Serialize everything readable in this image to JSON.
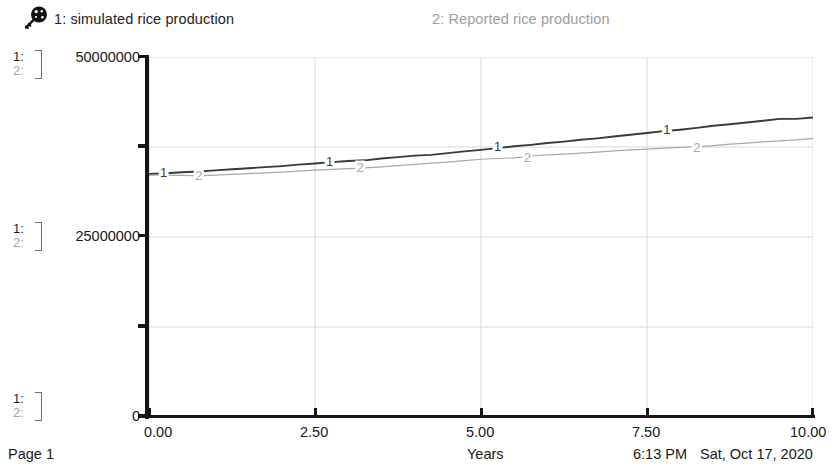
{
  "legend": {
    "icon": "key-icon",
    "series_1": "1: simulated rice production",
    "series_2": "2: Reported rice production"
  },
  "axis_index": {
    "row1": "1:",
    "row2": "2:"
  },
  "y_axis": {
    "top": "50000000",
    "mid": "25000000",
    "bottom": "0"
  },
  "x_axis": {
    "title": "Years",
    "ticks": [
      "0.00",
      "2.50",
      "5.00",
      "7.50",
      "10.00"
    ]
  },
  "footer": {
    "page": "Page 1",
    "time": "6:13 PM",
    "date": "Sat, Oct 17, 2020"
  },
  "colors": {
    "series_1": "#3a3a3a",
    "series_2": "#a8a8a8",
    "axis": "#151515",
    "grid": "#d8d8d8"
  },
  "chart_data": {
    "type": "line",
    "title": "",
    "xlabel": "Years",
    "ylabel": "",
    "xlim": [
      0,
      10
    ],
    "ylim": [
      0,
      50000000
    ],
    "grid": true,
    "legend_position": "top",
    "xticks": [
      0,
      2.5,
      5,
      7.5,
      10
    ],
    "yticks": [
      0,
      12500000,
      25000000,
      37500000,
      50000000
    ],
    "ytick_labels": [
      "0",
      "",
      "25000000",
      "",
      "50000000"
    ],
    "inline_markers": [
      {
        "series": "1",
        "x": 0.22,
        "y": 33900000
      },
      {
        "series": "2",
        "x": 0.75,
        "y": 33550000
      },
      {
        "series": "1",
        "x": 2.72,
        "y": 35500000
      },
      {
        "series": "2",
        "x": 3.18,
        "y": 34650000
      },
      {
        "series": "1",
        "x": 5.25,
        "y": 37550000
      },
      {
        "series": "2",
        "x": 5.7,
        "y": 36000000
      },
      {
        "series": "1",
        "x": 7.8,
        "y": 39900000
      },
      {
        "series": "2",
        "x": 8.25,
        "y": 37500000
      }
    ],
    "series": [
      {
        "name": "1: simulated rice production",
        "color": "#3a3a3a",
        "x": [
          0,
          0.25,
          0.5,
          0.75,
          1,
          1.25,
          1.5,
          1.75,
          2,
          2.25,
          2.5,
          2.75,
          3,
          3.25,
          3.5,
          3.75,
          4,
          4.25,
          4.5,
          4.75,
          5,
          5.25,
          5.5,
          5.75,
          6,
          6.25,
          6.5,
          6.75,
          7,
          7.25,
          7.5,
          7.75,
          8,
          8.25,
          8.5,
          8.75,
          9,
          9.25,
          9.5,
          9.75,
          10
        ],
        "values": [
          33750000,
          33850000,
          34000000,
          34100000,
          34250000,
          34400000,
          34550000,
          34700000,
          34850000,
          35050000,
          35200000,
          35400000,
          35550000,
          35650000,
          35900000,
          36100000,
          36300000,
          36400000,
          36650000,
          36900000,
          37100000,
          37350000,
          37600000,
          37800000,
          38050000,
          38250000,
          38500000,
          38700000,
          38950000,
          39200000,
          39450000,
          39700000,
          39900000,
          40150000,
          40450000,
          40650000,
          40900000,
          41150000,
          41400000,
          41400000,
          41600000
        ]
      },
      {
        "name": "2: Reported rice production",
        "color": "#a8a8a8",
        "x": [
          0,
          0.25,
          0.5,
          0.75,
          1,
          1.25,
          1.5,
          1.75,
          2,
          2.25,
          2.5,
          2.75,
          3,
          3.25,
          3.5,
          3.75,
          4,
          4.25,
          4.5,
          4.75,
          5,
          5.25,
          5.5,
          5.75,
          6,
          6.25,
          6.5,
          6.75,
          7,
          7.25,
          7.5,
          7.75,
          8,
          8.25,
          8.5,
          8.75,
          9,
          9.25,
          9.5,
          9.75,
          10
        ],
        "values": [
          33600000,
          33600000,
          33550000,
          33500000,
          33600000,
          33700000,
          33800000,
          33900000,
          34000000,
          34150000,
          34300000,
          34400000,
          34500000,
          34600000,
          34750000,
          34900000,
          35100000,
          35250000,
          35400000,
          35600000,
          35800000,
          35900000,
          36000000,
          36250000,
          36400000,
          36500000,
          36650000,
          36800000,
          36950000,
          37100000,
          37200000,
          37350000,
          37450000,
          37550000,
          37700000,
          37900000,
          38050000,
          38200000,
          38350000,
          38500000,
          38700000
        ]
      }
    ]
  }
}
